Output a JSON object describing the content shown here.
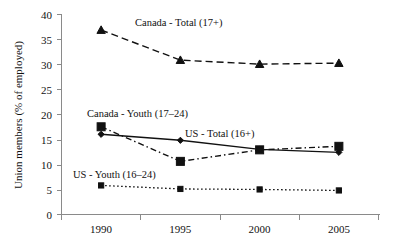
{
  "chart_data": {
    "type": "line",
    "title": "",
    "subtitle": "",
    "xlabel": "",
    "ylabel": "Union members (% of employed)",
    "categories": [
      "1990",
      "1995",
      "2000",
      "2005"
    ],
    "ylim": [
      0,
      40
    ],
    "ytick_step": 5,
    "yticks": [
      "0",
      "5",
      "10",
      "15",
      "20",
      "25",
      "30",
      "35",
      "40"
    ],
    "grid": false,
    "legend_position": "inline-annotations",
    "series": [
      {
        "name": "Canada - Total (17+)",
        "values": [
          36.8,
          30.8,
          30.0,
          30.2
        ],
        "marker": "triangle",
        "line_style": "dashed",
        "color": "#111111"
      },
      {
        "name": "Canada - Youth (17–24)",
        "values": [
          17.5,
          10.6,
          12.9,
          13.6
        ],
        "marker": "square",
        "line_style": "dash-dot",
        "color": "#111111"
      },
      {
        "name": "US - Total (16+)",
        "values": [
          16.0,
          14.8,
          13.0,
          12.4
        ],
        "marker": "diamond",
        "line_style": "solid",
        "color": "#111111"
      },
      {
        "name": "US - Youth (16–24)",
        "values": [
          5.8,
          5.1,
          5.0,
          4.8
        ],
        "marker": "small-square",
        "line_style": "dotted",
        "color": "#111111"
      }
    ],
    "annotations": [
      {
        "text": "Canada - Total (17+)",
        "x": 1995,
        "y": 37.5
      },
      {
        "text": "Canada - Youth (17–24)",
        "x": 1993,
        "y": 20.2
      },
      {
        "text": "US - Total (16+)",
        "x": 2000,
        "y": 15.6
      },
      {
        "text": "US - Youth (16–24)",
        "x": 1992,
        "y": 8.2
      }
    ]
  },
  "axis": {
    "y_title": "Union members (% of employed)",
    "y_tick_0": "0",
    "y_tick_1": "5",
    "y_tick_2": "10",
    "y_tick_3": "15",
    "y_tick_4": "20",
    "y_tick_5": "25",
    "y_tick_6": "30",
    "y_tick_7": "35",
    "y_tick_8": "40",
    "x_tick_0": "1990",
    "x_tick_1": "1995",
    "x_tick_2": "2000",
    "x_tick_3": "2005"
  },
  "annotations": {
    "canada_total": "Canada - Total (17+)",
    "canada_youth": "Canada - Youth (17–24)",
    "us_total": "US - Total (16+)",
    "us_youth": "US - Youth (16–24)"
  }
}
